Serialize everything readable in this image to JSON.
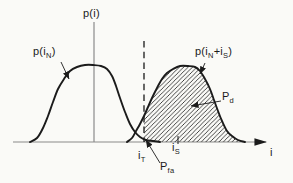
{
  "figure_title": "signal-detection probability densities",
  "colors": {
    "background": "#fafaf7",
    "ink": "#1b1b1b",
    "axis": "#8a8a8a"
  },
  "labels": {
    "p_i": {
      "text": "p(i)",
      "x": 83,
      "y": 8
    },
    "p_iN": {
      "p1": "p(i",
      "s1": "N",
      "p2": ")",
      "x": 33,
      "y": 46
    },
    "p_iNiS": {
      "p1": "p(i",
      "s1": "N",
      "p2": "+i",
      "s2": "S",
      "p3": ")",
      "x": 195,
      "y": 46
    },
    "P_d": {
      "p1": "P",
      "s1": "d",
      "x": 222,
      "y": 91
    },
    "i_T": {
      "p1": "i",
      "s1": "T",
      "x": 138,
      "y": 150
    },
    "P_fa": {
      "p1": "P",
      "s1": "fa",
      "x": 160,
      "y": 161
    },
    "i_S": {
      "p1": "i",
      "s1": "S",
      "x": 172,
      "y": 142
    },
    "i_axis": {
      "text": "i",
      "x": 270,
      "y": 147
    }
  },
  "chart_data": {
    "type": "area",
    "xlabel": "i",
    "ylabel": "p(i)",
    "baseline_y": 142,
    "axes": {
      "x": {
        "x1": 13,
        "y": 142,
        "x2": 266
      },
      "y": {
        "x": 94,
        "y1": 22,
        "y2": 142
      }
    },
    "threshold": {
      "x": 144,
      "top": 41
    },
    "signal_mean_tick": {
      "x": 178,
      "y1": 136,
      "y2": 144
    },
    "curves": [
      {
        "name": "p(iN)",
        "points": [
          [
            30,
            142
          ],
          [
            37,
            138
          ],
          [
            43,
            128
          ],
          [
            48,
            116
          ],
          [
            53,
            102
          ],
          [
            58,
            89
          ],
          [
            64,
            79
          ],
          [
            70,
            71
          ],
          [
            77,
            67
          ],
          [
            85,
            65
          ],
          [
            93,
            65
          ],
          [
            101,
            66
          ],
          [
            107,
            69
          ],
          [
            112,
            76
          ],
          [
            116,
            86
          ],
          [
            120,
            98
          ],
          [
            125,
            112
          ],
          [
            130,
            124
          ],
          [
            135,
            132
          ],
          [
            140,
            137
          ],
          [
            146,
            140
          ],
          [
            153,
            141
          ],
          [
            160,
            142
          ]
        ]
      },
      {
        "name": "p(iN+iS)",
        "points": [
          [
            127,
            142
          ],
          [
            132,
            138
          ],
          [
            136,
            131
          ],
          [
            140,
            124
          ],
          [
            144,
            116
          ],
          [
            148,
            107
          ],
          [
            152,
            98
          ],
          [
            157,
            88
          ],
          [
            162,
            79
          ],
          [
            167,
            73
          ],
          [
            173,
            69
          ],
          [
            180,
            66
          ],
          [
            188,
            66
          ],
          [
            195,
            67
          ],
          [
            200,
            71
          ],
          [
            205,
            79
          ],
          [
            210,
            89
          ],
          [
            214,
            100
          ],
          [
            218,
            111
          ],
          [
            222,
            121
          ],
          [
            227,
            131
          ],
          [
            232,
            136
          ],
          [
            238,
            140
          ],
          [
            245,
            142
          ]
        ]
      }
    ],
    "hatch_from_x": 144,
    "arrows": [
      {
        "name": "p-iN-arrow",
        "x1": 61,
        "y1": 62,
        "x2": 69,
        "y2": 79
      },
      {
        "name": "p-iNiS-arrow",
        "x1": 205,
        "y1": 63,
        "x2": 200,
        "y2": 74
      },
      {
        "name": "pd-arrow",
        "x1": 221,
        "y1": 101,
        "x2": 191,
        "y2": 106
      },
      {
        "name": "pfa-arrow",
        "x1": 160,
        "y1": 163,
        "x2": 146,
        "y2": 140
      }
    ]
  }
}
